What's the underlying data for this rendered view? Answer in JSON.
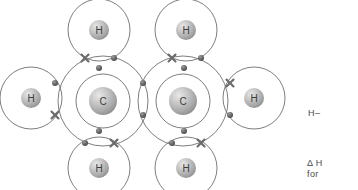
{
  "figure": {
    "type": "dot-and-cross-diagram",
    "molecule": "ethene",
    "background_color": "#ffffff",
    "shell_stroke": "#6f6f6f",
    "electron_dot_color": "#5a5a5a",
    "electron_cross_color": "#6b6b6b",
    "atom_sphere_color": "#b4b4b4",
    "atom_label_color": "#3c3c3c"
  },
  "atoms": [
    {
      "id": "carbon-left",
      "label": "C",
      "cx": 103,
      "cy": 101,
      "sphere_r": 14,
      "inner_shell_r": 27,
      "outer_shell_r": 45
    },
    {
      "id": "carbon-right",
      "label": "C",
      "cx": 183,
      "cy": 101,
      "sphere_r": 14,
      "inner_shell_r": 27,
      "outer_shell_r": 45
    },
    {
      "id": "hydrogen-top-left",
      "label": "H",
      "cx": 99,
      "cy": 30,
      "sphere_r": 10,
      "shell_r": 31
    },
    {
      "id": "hydrogen-top-right",
      "label": "H",
      "cx": 186,
      "cy": 30,
      "sphere_r": 10,
      "shell_r": 31
    },
    {
      "id": "hydrogen-left",
      "label": "H",
      "cx": 31,
      "cy": 98,
      "sphere_r": 10,
      "shell_r": 31
    },
    {
      "id": "hydrogen-right",
      "label": "H",
      "cx": 254,
      "cy": 98,
      "sphere_r": 10,
      "shell_r": 31
    },
    {
      "id": "hydrogen-bottom-left",
      "label": "H",
      "cx": 99,
      "cy": 168,
      "sphere_r": 10,
      "shell_r": 31
    },
    {
      "id": "hydrogen-bottom-right",
      "label": "H",
      "cx": 186,
      "cy": 168,
      "sphere_r": 10,
      "shell_r": 31
    }
  ],
  "electrons": [
    {
      "id": "bond-top-left-cross",
      "type": "cross",
      "x": 85,
      "y": 58
    },
    {
      "id": "bond-top-left-dot",
      "type": "dot",
      "x": 114,
      "y": 58
    },
    {
      "id": "bond-top-right-cross",
      "type": "cross",
      "x": 172,
      "y": 58
    },
    {
      "id": "bond-top-right-dot",
      "type": "dot",
      "x": 201,
      "y": 58
    },
    {
      "id": "bond-left-dot",
      "type": "dot",
      "x": 55,
      "y": 83
    },
    {
      "id": "bond-left-cross",
      "type": "cross",
      "x": 55,
      "y": 115
    },
    {
      "id": "bond-right-cross",
      "type": "cross",
      "x": 230,
      "y": 83
    },
    {
      "id": "bond-right-dot",
      "type": "dot",
      "x": 230,
      "y": 115
    },
    {
      "id": "bond-bottom-left-dot",
      "type": "dot",
      "x": 85,
      "y": 143
    },
    {
      "id": "bond-bottom-left-cross",
      "type": "cross",
      "x": 114,
      "y": 143
    },
    {
      "id": "bond-bottom-right-dot",
      "type": "dot",
      "x": 172,
      "y": 143
    },
    {
      "id": "bond-bottom-right-cross",
      "type": "cross",
      "x": 201,
      "y": 143
    },
    {
      "id": "double-bond-dot-upper",
      "type": "dot",
      "x": 143,
      "y": 83
    },
    {
      "id": "double-bond-dot-lower",
      "type": "dot",
      "x": 143,
      "y": 115
    },
    {
      "id": "carbon-left-dot-top",
      "type": "dot",
      "x": 99,
      "y": 68
    },
    {
      "id": "carbon-left-dot-bottom",
      "type": "dot",
      "x": 99,
      "y": 131
    },
    {
      "id": "carbon-right-dot-top",
      "type": "dot",
      "x": 184,
      "y": 68
    },
    {
      "id": "carbon-right-dot-bottom",
      "type": "dot",
      "x": 184,
      "y": 131
    }
  ],
  "side_notes": {
    "structural_formula": "H–",
    "enthalpy_line1": "Δ H",
    "enthalpy_line2": "for"
  }
}
